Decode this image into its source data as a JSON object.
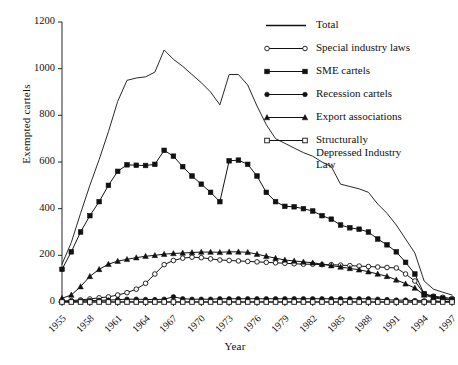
{
  "chart_data": {
    "type": "line",
    "title": "",
    "xlabel": "Year",
    "ylabel": "Exempted cartels",
    "xlim": [
      1955,
      1997
    ],
    "ylim": [
      0,
      1200
    ],
    "yticks": [
      0,
      200,
      400,
      600,
      800,
      1000,
      1200
    ],
    "ytick_labels": [
      "0",
      "200",
      "400",
      "600",
      "800",
      "1000",
      "1200"
    ],
    "xticks": [
      1955,
      1958,
      1961,
      1964,
      1967,
      1970,
      1973,
      1976,
      1979,
      1982,
      1985,
      1988,
      1991,
      1994,
      1997
    ],
    "xtick_labels": [
      "1955",
      "1958",
      "1961",
      "1964",
      "1967",
      "1970",
      "1973",
      "1976",
      "1979",
      "1982",
      "1985",
      "1988",
      "1991",
      "1994",
      "1997"
    ],
    "grid": false,
    "legend_position": "top-right",
    "x": [
      1955,
      1956,
      1957,
      1958,
      1959,
      1960,
      1961,
      1962,
      1963,
      1964,
      1965,
      1966,
      1967,
      1968,
      1969,
      1970,
      1971,
      1972,
      1973,
      1974,
      1975,
      1976,
      1977,
      1978,
      1979,
      1980,
      1981,
      1982,
      1983,
      1984,
      1985,
      1986,
      1987,
      1988,
      1989,
      1990,
      1991,
      1992,
      1993,
      1994,
      1995,
      1996,
      1997
    ],
    "series": [
      {
        "name": "Total",
        "marker": "none",
        "color": "#111111",
        "values": [
          162,
          255,
          380,
          500,
          610,
          730,
          860,
          950,
          960,
          965,
          985,
          1080,
          1040,
          1010,
          975,
          940,
          900,
          845,
          975,
          975,
          930,
          840,
          760,
          700,
          680,
          660,
          640,
          625,
          600,
          580,
          505,
          495,
          485,
          470,
          420,
          380,
          330,
          270,
          210,
          90,
          55,
          42,
          30
        ]
      },
      {
        "name": "Special industry laws",
        "marker": "open-circle",
        "color": "#111111",
        "values": [
          4,
          6,
          9,
          13,
          18,
          22,
          30,
          40,
          55,
          80,
          120,
          160,
          178,
          188,
          192,
          190,
          185,
          180,
          178,
          176,
          174,
          172,
          170,
          168,
          166,
          164,
          162,
          162,
          160,
          160,
          158,
          156,
          154,
          152,
          150,
          148,
          146,
          120,
          90,
          35,
          25,
          20,
          15
        ]
      },
      {
        "name": "SME cartels",
        "marker": "filled-square",
        "color": "#111111",
        "values": [
          140,
          215,
          300,
          370,
          430,
          500,
          560,
          588,
          586,
          585,
          590,
          650,
          625,
          580,
          540,
          505,
          470,
          430,
          605,
          608,
          590,
          540,
          470,
          430,
          410,
          408,
          400,
          390,
          370,
          355,
          330,
          318,
          312,
          300,
          270,
          245,
          215,
          170,
          120,
          35,
          22,
          16,
          10
        ]
      },
      {
        "name": "Recession cartels",
        "marker": "filled-circle",
        "color": "#111111",
        "values": [
          2,
          3,
          5,
          6,
          7,
          8,
          10,
          12,
          12,
          11,
          10,
          12,
          22,
          14,
          12,
          12,
          12,
          14,
          14,
          14,
          14,
          14,
          14,
          14,
          14,
          14,
          14,
          14,
          14,
          14,
          14,
          14,
          14,
          14,
          12,
          10,
          8,
          8,
          6,
          5,
          4,
          3,
          2
        ]
      },
      {
        "name": "Export associations",
        "marker": "filled-triangle",
        "color": "#111111",
        "values": [
          16,
          30,
          66,
          110,
          140,
          162,
          175,
          183,
          190,
          196,
          200,
          205,
          208,
          210,
          212,
          214,
          214,
          213,
          215,
          215,
          213,
          205,
          196,
          188,
          180,
          176,
          172,
          168,
          162,
          156,
          150,
          144,
          138,
          130,
          120,
          110,
          95,
          78,
          60,
          30,
          18,
          12,
          8
        ]
      },
      {
        "name": "Structurally Depressed Industry Law",
        "marker": "open-square",
        "color": "#111111",
        "values": [
          0,
          0,
          0,
          0,
          0,
          0,
          0,
          0,
          0,
          0,
          0,
          0,
          0,
          0,
          0,
          0,
          0,
          0,
          0,
          0,
          0,
          0,
          0,
          0,
          0,
          0,
          0,
          0,
          0,
          0,
          0,
          0,
          0,
          0,
          0,
          0,
          0,
          0,
          0,
          0,
          0,
          0,
          0
        ]
      }
    ]
  },
  "legend": {
    "items": [
      {
        "label": "Total",
        "marker": "none"
      },
      {
        "label": "Special industry laws",
        "marker": "open-circle"
      },
      {
        "label": "SME cartels",
        "marker": "filled-square"
      },
      {
        "label": "Recession cartels",
        "marker": "filled-circle"
      },
      {
        "label": "Export associations",
        "marker": "filled-triangle"
      },
      {
        "label": "Structurally\nDepressed Industry\nLaw",
        "marker": "open-square"
      }
    ]
  },
  "colors": {
    "ink": "#111111",
    "background": "#ffffff"
  }
}
